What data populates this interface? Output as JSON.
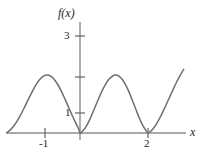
{
  "figure": {
    "name": "function-graph",
    "width": 208,
    "height": 162,
    "background": "#ffffff",
    "line_color": "#6d6e71",
    "axis_color": "#808285",
    "text_color": "#231f20"
  },
  "labels": {
    "y_axis": "f(x)",
    "x_axis": "x"
  },
  "chart_data": {
    "type": "line",
    "title": "",
    "xlabel": "x",
    "ylabel": "f(x)",
    "xlim": [
      -2.2,
      3.15
    ],
    "ylim": [
      0,
      3.6
    ],
    "grid": false,
    "legend": null,
    "x_ticks": [
      -1,
      2
    ],
    "x_tick_labels": [
      "-1",
      "2"
    ],
    "y_ticks": [
      1,
      2,
      3
    ],
    "y_tick_labels": [
      "1",
      "",
      "3"
    ],
    "origin_px": {
      "x": 80,
      "y": 133
    },
    "unit_px": {
      "x": 34,
      "y": 19.3
    },
    "annotations": [
      {
        "text": "zero (tangent) at x = 0",
        "x": 0,
        "y": 0
      },
      {
        "text": "zero (tangent) at x = 2",
        "x": 2,
        "y": 0
      },
      {
        "text": "local maximum near 3",
        "x": -0.95,
        "y": 3
      },
      {
        "text": "local maximum near 3",
        "x": 1.05,
        "y": 3
      }
    ],
    "series": [
      {
        "name": "f",
        "x": [
          -2.15,
          -2.05,
          -1.95,
          -1.85,
          -1.75,
          -1.65,
          -1.55,
          -1.45,
          -1.35,
          -1.25,
          -1.15,
          -1.05,
          -0.95,
          -0.85,
          -0.75,
          -0.65,
          -0.55,
          -0.45,
          -0.35,
          -0.25,
          -0.15,
          -0.05,
          0,
          0.05,
          0.15,
          0.25,
          0.35,
          0.45,
          0.55,
          0.65,
          0.75,
          0.85,
          0.95,
          1.05,
          1.15,
          1.25,
          1.35,
          1.45,
          1.55,
          1.65,
          1.75,
          1.85,
          1.95,
          2,
          2.05,
          2.15,
          2.25,
          2.35,
          2.45,
          2.55,
          2.65,
          2.75,
          2.85,
          2.95,
          3.05
        ],
        "y": [
          0.02,
          0.16,
          0.36,
          0.62,
          0.93,
          1.27,
          1.63,
          1.99,
          2.33,
          2.62,
          2.84,
          2.97,
          3.0,
          2.93,
          2.76,
          2.5,
          2.17,
          1.79,
          1.39,
          0.99,
          0.6,
          0.25,
          0.0,
          0.05,
          0.25,
          0.56,
          0.95,
          1.37,
          1.79,
          2.18,
          2.52,
          2.78,
          2.94,
          3.0,
          2.94,
          2.76,
          2.47,
          2.09,
          1.65,
          1.19,
          0.75,
          0.38,
          0.1,
          0.0,
          0.05,
          0.22,
          0.47,
          0.79,
          1.15,
          1.53,
          1.92,
          2.3,
          2.67,
          3.0,
          3.3
        ]
      }
    ]
  }
}
